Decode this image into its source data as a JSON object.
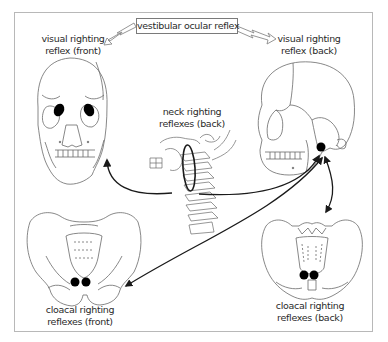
{
  "diagram": {
    "labels": {
      "vestibular_ocular_reflex": "vestibular  ocular reflex",
      "visual_front_line1": "visual righting",
      "visual_front_line2": "reflex (front)",
      "visual_back_line1": "visual righting",
      "visual_back_line2": "reflex (back)",
      "neck_line1": "neck righting",
      "neck_line2": "reflexes (back)",
      "cloacal_front_line1": "cloacal righting",
      "cloacal_front_line2": "reflexes (front)",
      "cloacal_back_line1": "cloacal righting",
      "cloacal_back_line2": "reflexes (back)"
    },
    "figures": [
      {
        "name": "skull-front",
        "description": "human skull, frontal view, with black dots over both orbits"
      },
      {
        "name": "skull-side",
        "description": "human skull, lateral view, with black dot near inner ear"
      },
      {
        "name": "cervical-spine",
        "description": "cervical vertebrae with jaw, neck region circled by ellipse"
      },
      {
        "name": "pelvis-front",
        "description": "pelvis, front view, two black dots at pubic area"
      },
      {
        "name": "pelvis-back",
        "description": "pelvis, back view, two black dots at sacrum base"
      }
    ],
    "arrows": [
      {
        "from": "vestibular ocular reflex",
        "to": "visual righting reflex (front)",
        "style": "hollow"
      },
      {
        "from": "vestibular ocular reflex",
        "to": "visual righting reflex (back)",
        "style": "hollow"
      },
      {
        "from": "neck",
        "to": "skull-front",
        "style": "curved"
      },
      {
        "from": "neck",
        "to": "inner ear dot",
        "style": "curved"
      },
      {
        "from": "pelvis-front",
        "to": "inner ear dot",
        "style": "double-headed"
      },
      {
        "from": "pelvis-back",
        "to": "inner ear dot",
        "style": "double-headed"
      }
    ],
    "colors": {
      "ink": "#1a1a1a",
      "line_art": "#6a6a6a",
      "frame": "#b8b8b8",
      "dot": "#000000"
    }
  }
}
